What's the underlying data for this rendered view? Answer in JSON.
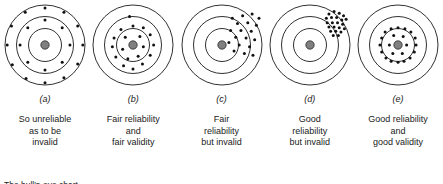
{
  "figure": {
    "note": "The bull's-eye chart",
    "ring_stroke": "#1a1a1a",
    "dot_color": "#111111",
    "center_color": "#808080",
    "panels": [
      {
        "letter": "(a)",
        "caption": "So unreliable\nas to be\ninvalid",
        "dots": [
          [
            0.5,
            0.07
          ],
          [
            0.72,
            0.12
          ],
          [
            0.88,
            0.28
          ],
          [
            0.94,
            0.5
          ],
          [
            0.88,
            0.72
          ],
          [
            0.72,
            0.88
          ],
          [
            0.5,
            0.94
          ],
          [
            0.28,
            0.89
          ],
          [
            0.12,
            0.73
          ],
          [
            0.06,
            0.5
          ],
          [
            0.11,
            0.28
          ],
          [
            0.27,
            0.12
          ],
          [
            0.5,
            0.21
          ],
          [
            0.7,
            0.3
          ],
          [
            0.79,
            0.5
          ],
          [
            0.7,
            0.7
          ],
          [
            0.5,
            0.79
          ],
          [
            0.3,
            0.7
          ],
          [
            0.21,
            0.5
          ],
          [
            0.3,
            0.3
          ]
        ]
      },
      {
        "letter": "(b)",
        "caption": "Fair reliability\nand\nfair validity",
        "dots": [
          [
            0.46,
            0.17
          ],
          [
            0.5,
            0.28
          ],
          [
            0.62,
            0.3
          ],
          [
            0.36,
            0.32
          ],
          [
            0.7,
            0.38
          ],
          [
            0.28,
            0.42
          ],
          [
            0.58,
            0.4
          ],
          [
            0.41,
            0.41
          ],
          [
            0.74,
            0.5
          ],
          [
            0.26,
            0.52
          ],
          [
            0.62,
            0.52
          ],
          [
            0.38,
            0.55
          ],
          [
            0.7,
            0.62
          ],
          [
            0.3,
            0.64
          ],
          [
            0.56,
            0.63
          ],
          [
            0.44,
            0.66
          ],
          [
            0.61,
            0.72
          ],
          [
            0.39,
            0.74
          ],
          [
            0.5,
            0.78
          ]
        ]
      },
      {
        "letter": "(c)",
        "caption": "Fair\nreliability\nbut invalid",
        "dots": [
          [
            0.62,
            0.19
          ],
          [
            0.74,
            0.16
          ],
          [
            0.85,
            0.14
          ],
          [
            0.93,
            0.19
          ],
          [
            0.68,
            0.25
          ],
          [
            0.8,
            0.24
          ],
          [
            0.9,
            0.27
          ],
          [
            0.6,
            0.33
          ],
          [
            0.72,
            0.33
          ],
          [
            0.84,
            0.34
          ],
          [
            0.66,
            0.41
          ],
          [
            0.78,
            0.42
          ],
          [
            0.88,
            0.44
          ],
          [
            0.58,
            0.47
          ],
          [
            0.7,
            0.5
          ],
          [
            0.82,
            0.52
          ],
          [
            0.64,
            0.57
          ],
          [
            0.76,
            0.6
          ],
          [
            0.86,
            0.62
          ]
        ]
      },
      {
        "letter": "(d)",
        "caption": "Good\nreliability\nbut invalid",
        "dots": [
          [
            0.72,
            0.14
          ],
          [
            0.78,
            0.11
          ],
          [
            0.84,
            0.13
          ],
          [
            0.89,
            0.16
          ],
          [
            0.69,
            0.19
          ],
          [
            0.75,
            0.18
          ],
          [
            0.81,
            0.18
          ],
          [
            0.87,
            0.21
          ],
          [
            0.92,
            0.2
          ],
          [
            0.7,
            0.24
          ],
          [
            0.76,
            0.24
          ],
          [
            0.82,
            0.24
          ],
          [
            0.88,
            0.26
          ],
          [
            0.72,
            0.29
          ],
          [
            0.78,
            0.29
          ],
          [
            0.84,
            0.3
          ],
          [
            0.9,
            0.31
          ],
          [
            0.74,
            0.34
          ],
          [
            0.8,
            0.34
          ],
          [
            0.86,
            0.35
          ],
          [
            0.77,
            0.39
          ],
          [
            0.83,
            0.39
          ]
        ]
      },
      {
        "letter": "(e)",
        "caption": "Good reliability\nand\ngood validity",
        "dots": [
          [
            0.5,
            0.3
          ],
          [
            0.58,
            0.31
          ],
          [
            0.65,
            0.35
          ],
          [
            0.7,
            0.42
          ],
          [
            0.71,
            0.5
          ],
          [
            0.69,
            0.58
          ],
          [
            0.64,
            0.65
          ],
          [
            0.57,
            0.69
          ],
          [
            0.5,
            0.7
          ],
          [
            0.42,
            0.69
          ],
          [
            0.36,
            0.65
          ],
          [
            0.31,
            0.58
          ],
          [
            0.29,
            0.5
          ],
          [
            0.31,
            0.42
          ],
          [
            0.35,
            0.35
          ],
          [
            0.42,
            0.31
          ],
          [
            0.45,
            0.39
          ],
          [
            0.56,
            0.4
          ],
          [
            0.6,
            0.5
          ],
          [
            0.55,
            0.6
          ],
          [
            0.44,
            0.6
          ],
          [
            0.4,
            0.5
          ]
        ]
      }
    ]
  }
}
